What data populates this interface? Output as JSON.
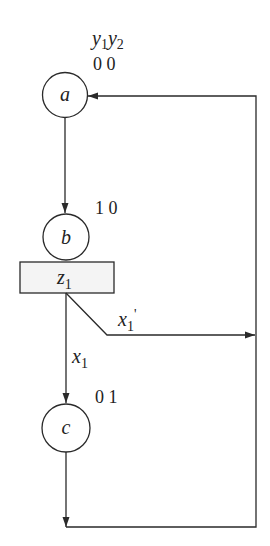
{
  "diagram": {
    "type": "ASM chart / state diagram",
    "header_label": {
      "var1": "y",
      "sub1": "1",
      "var2": "y",
      "sub2": "2"
    },
    "states": [
      {
        "id": "a",
        "label": "a",
        "code": "0 0"
      },
      {
        "id": "b",
        "label": "b",
        "code": "1 0"
      },
      {
        "id": "c",
        "label": "c",
        "code": "0 1"
      }
    ],
    "output_box": {
      "var": "z",
      "sub": "1"
    },
    "conditions": [
      {
        "var": "x",
        "sub": "1",
        "prime": "",
        "target": "c"
      },
      {
        "var": "x",
        "sub": "1",
        "prime": "'",
        "target": "a"
      }
    ],
    "colors": {
      "stroke": "#2a2a2a",
      "box_fill": "#f4f4f4",
      "background": "#ffffff"
    }
  }
}
